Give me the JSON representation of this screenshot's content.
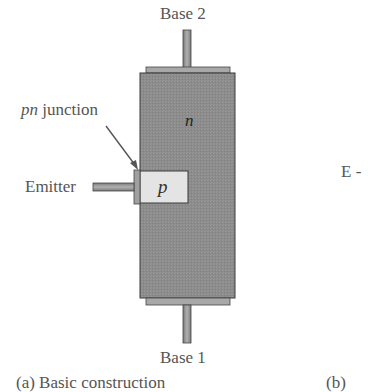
{
  "figure": {
    "labels": {
      "base2": "Base 2",
      "base1": "Base 1",
      "pn_junction_italic": "pn",
      "pn_junction_rest": " junction",
      "emitter": "Emitter",
      "n_region": "n",
      "p_region": "p",
      "right_partial": "E -"
    },
    "captions": {
      "a": "(a) Basic construction",
      "b": "(b)"
    },
    "colors": {
      "n_body": "#8c8c8c",
      "n_body_border": "#3a3a3a",
      "contact_plate": "#a8a8a8",
      "p_region": "#e4e4e4",
      "terminal_rod": "#9a9a9a",
      "arrow": "#555555",
      "text": "#555555"
    }
  }
}
